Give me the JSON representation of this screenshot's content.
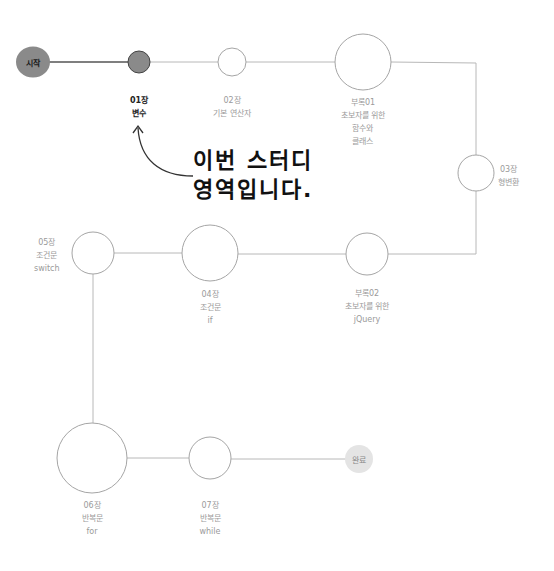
{
  "colors": {
    "line_done": "#555555",
    "line_todo": "#b8b8b8",
    "node_done": "#8a8a8a",
    "node_border": "#9a9a9a",
    "end_fill": "#e4e4e4",
    "active_text": "#222222",
    "inactive_text": "#9a9a9a"
  },
  "start": {
    "label": "시작"
  },
  "end": {
    "label": "완료"
  },
  "nodes": [
    {
      "id": "ch01",
      "lines": [
        "01장",
        "변수"
      ],
      "active": true
    },
    {
      "id": "ch02",
      "lines": [
        "02장",
        "기본 연산자"
      ]
    },
    {
      "id": "app01",
      "lines": [
        "부록01",
        "초보자를 위한",
        "함수와",
        "클래스"
      ]
    },
    {
      "id": "ch03",
      "lines": [
        "03장",
        "형변환"
      ]
    },
    {
      "id": "app02",
      "lines": [
        "부록02",
        "초보자를 위한",
        "jQuery"
      ]
    },
    {
      "id": "ch04",
      "lines": [
        "04장",
        "조건문",
        "if"
      ]
    },
    {
      "id": "ch05",
      "lines": [
        "05장",
        "조건문",
        "switch"
      ]
    },
    {
      "id": "ch06",
      "lines": [
        "06장",
        "반복문",
        "for"
      ]
    },
    {
      "id": "ch07",
      "lines": [
        "07장",
        "반복문",
        "while"
      ]
    }
  ],
  "callout": {
    "lines": [
      "이번 스터디",
      "영역입니다."
    ]
  }
}
